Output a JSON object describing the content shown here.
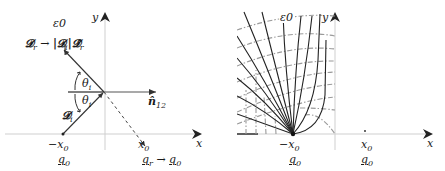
{
  "left_panel": {
    "medium_label": "ε0",
    "y_axis_label": "y",
    "x_axis_label": "x",
    "reflected_field_label": "𝓓r → |𝓓i|𝓓̂r",
    "reflected_field_lhs": "𝓓",
    "reflected_field_lhs_sub": "r",
    "reflected_arrow": "→",
    "reflected_field_rhs": "|𝓓",
    "reflected_field_rhs_sub": "i",
    "reflected_field_rhs2": "|𝓓̂",
    "reflected_field_rhs2_sub": "r",
    "angle_upper": "θ",
    "angle_upper_sub": "i",
    "angle_lower": "θ",
    "angle_lower_sub": "i",
    "normal_label": "n̂",
    "normal_sub": "12",
    "incident_field_label": "𝓓",
    "incident_field_sub": "i",
    "source_position": "−x",
    "source_position_sub": "0",
    "source_charge": "q",
    "source_charge_sub": "0",
    "image_position": "x",
    "image_position_sub": "0",
    "image_charge": "q",
    "image_charge_sub": "r",
    "image_arrow": "→",
    "image_charge_limit": "q",
    "image_charge_limit_sub": "0"
  },
  "right_panel": {
    "medium_label": "ε0",
    "y_axis_label": "y",
    "x_axis_label": "x",
    "source_position": "−x",
    "source_position_sub": "0",
    "source_charge": "q",
    "source_charge_sub": "0",
    "image_position": "x",
    "image_position_sub": "0",
    "image_charge": "q",
    "image_charge_sub": "0",
    "field_line_count": 12,
    "equipotential_style": "dash-dot gray"
  },
  "colors": {
    "field_line": "#222222",
    "equipotential": "#9a9a9a",
    "axis": "#c8c8c8",
    "arrow": "#333333"
  }
}
